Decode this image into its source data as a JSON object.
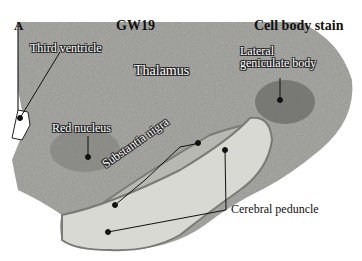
{
  "figure": {
    "panel_letter": "A",
    "age": "GW19",
    "stain": "Cell body stain",
    "labels": {
      "third_ventricle": "Third ventricle",
      "thalamus": "Thalamus",
      "lateral_geniculate_line1": "Lateral",
      "lateral_geniculate_line2": "geniculate body",
      "red_nucleus": "Red nucleus",
      "substantia_nigra": "Substantia nigra",
      "cerebral_peduncle": "Cerebral peduncle"
    },
    "colors": {
      "tissue": "#9a9a96",
      "tissue_dark": "#6e6e6a",
      "peduncle": "#d9d9d4",
      "outline": "#7a7a76",
      "background": "#ffffff"
    }
  }
}
